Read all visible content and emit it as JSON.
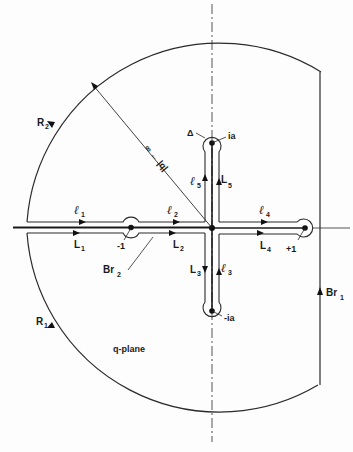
{
  "figure": {
    "plane_label": "q-plane",
    "radius_label": "∞ ← |q|",
    "points": {
      "origin": "0",
      "minus_one": "-1",
      "plus_one": "+1",
      "upper_pole": "ia",
      "lower_pole": "-ia",
      "delta": "Δ"
    },
    "contours": {
      "R1": {
        "main": "R",
        "sub": "1"
      },
      "R2": {
        "main": "R",
        "sub": "2"
      },
      "Br1": {
        "main": "Br",
        "sub": "1"
      },
      "Br2": {
        "main": "Br",
        "sub": "2"
      },
      "L1": {
        "main": "L",
        "sub": "1"
      },
      "L2": {
        "main": "L",
        "sub": "2"
      },
      "L3": {
        "main": "L",
        "sub": "3"
      },
      "L4": {
        "main": "L",
        "sub": "4"
      },
      "L5": {
        "main": "L",
        "sub": "5"
      },
      "l1": {
        "main": "ℓ",
        "sub": "1"
      },
      "l2": {
        "main": "ℓ",
        "sub": "2"
      },
      "l3": {
        "main": "ℓ",
        "sub": "3"
      },
      "l4": {
        "main": "ℓ",
        "sub": "4"
      },
      "l5": {
        "main": "ℓ",
        "sub": "5"
      }
    },
    "colors": {
      "ink": "#2a2a2a",
      "background": "#fdfdfd"
    }
  }
}
